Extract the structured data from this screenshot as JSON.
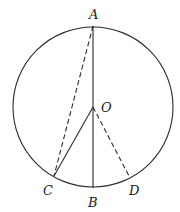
{
  "diagram": {
    "stroke_color": "#2b2b2b",
    "circle": {
      "cx": 93,
      "cy": 107,
      "r": 80
    },
    "points": {
      "A": {
        "x": 93,
        "y": 26
      },
      "O": {
        "x": 93,
        "y": 107
      },
      "B": {
        "x": 93,
        "y": 188
      },
      "C": {
        "x": 54,
        "y": 176
      },
      "D": {
        "x": 129,
        "y": 176
      }
    },
    "labels": {
      "A": "A",
      "O": "O",
      "B": "B",
      "C": "C",
      "D": "D"
    },
    "segments": [
      {
        "from": "A",
        "to": "B",
        "style": "solid"
      },
      {
        "from": "O",
        "to": "C",
        "style": "solid"
      },
      {
        "from": "A",
        "to": "C",
        "style": "dashed"
      },
      {
        "from": "O",
        "to": "D",
        "style": "dashed"
      }
    ]
  }
}
